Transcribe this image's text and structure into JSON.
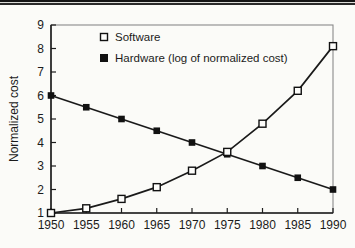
{
  "figure": {
    "description_labels": {
      "y_axis_title": "Normalized cost"
    }
  },
  "chart_data": {
    "type": "line",
    "title": "",
    "xlabel": "",
    "ylabel": "Normalized cost",
    "x": [
      1950,
      1955,
      1960,
      1965,
      1970,
      1975,
      1980,
      1985,
      1990
    ],
    "categories": [
      "1950",
      "1955",
      "1960",
      "1965",
      "1970",
      "1975",
      "1980",
      "1985",
      "1990"
    ],
    "y_ticks": [
      1,
      2,
      3,
      4,
      5,
      6,
      7,
      8,
      9
    ],
    "xlim": [
      1950,
      1990
    ],
    "ylim": [
      1,
      9
    ],
    "grid": false,
    "legend_position": "top-left-inside",
    "line_color": "#1a1a1a",
    "frame_color": "#8a8a8a",
    "background_color": "#fbfbf8",
    "series": [
      {
        "name": "Software",
        "marker": "open-square",
        "values": [
          1.0,
          1.2,
          1.6,
          2.1,
          2.8,
          3.6,
          4.8,
          6.2,
          8.1
        ]
      },
      {
        "name": "Hardware (log of normalized cost)",
        "marker": "filled-square",
        "values": [
          6.0,
          5.5,
          5.0,
          4.5,
          4.0,
          3.5,
          3.0,
          2.5,
          2.0
        ]
      }
    ]
  }
}
